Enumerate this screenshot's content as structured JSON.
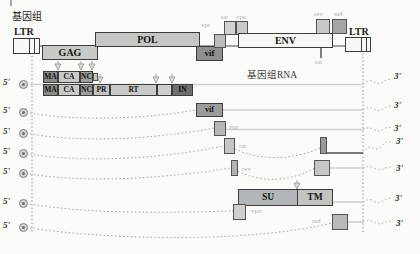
{
  "map": {
    "genome_label": "基因组",
    "ltr_label": "LTR",
    "gag_label": "GAG",
    "pol_label": "POL",
    "env_label": "ENV",
    "vif_label": "vif",
    "vpr_label": "vpr",
    "tat_label": "tat",
    "vpu_label": "vpu",
    "rev_label": "rev",
    "nef_label": "nef"
  },
  "proteins": {
    "ma": "MA",
    "ca": "CA",
    "nc": "NC",
    "pr": "PR",
    "rt": "RT",
    "in": "IN",
    "su": "SU",
    "tm": "TM"
  },
  "rna": {
    "genomic_rna_label": "基因组RNA",
    "five_prime": "5'",
    "three_prime": "3'"
  },
  "colors": {
    "page_bg": "#fbfbf9",
    "dark_box": "#8f8f8d",
    "medium_box": "#a6a6a4",
    "light_box": "#c9c9c7",
    "white_box": "#f8f8f6",
    "row_line_light": "#d0d0ce",
    "row_line_dark": "#4f4f4d",
    "muted_label": "#b2b2b0"
  }
}
